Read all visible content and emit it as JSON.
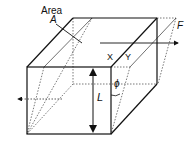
{
  "diagram": {
    "labels": {
      "area": "Area",
      "a": "A",
      "x": "X",
      "y": "Y",
      "force": "F",
      "length": "L",
      "angle": "ϕ"
    },
    "colors": {
      "line": "#111111",
      "hidden_line": "#555555",
      "background": "#ffffff"
    }
  }
}
